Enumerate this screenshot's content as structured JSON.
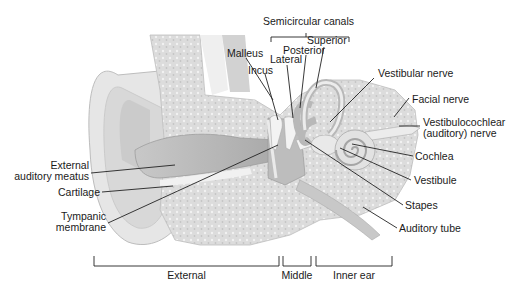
{
  "title": "Semicircular canals",
  "labels": {
    "semicircular_canals": "Semicircular canals",
    "superior": "Superior",
    "posterior": "Posterior",
    "lateral": "Lateral",
    "malleus": "Malleus",
    "incus": "Incus",
    "vestibular_nerve": "Vestibular nerve",
    "facial_nerve": "Facial nerve",
    "vestibulocochlear_1": "Vestibulocochlear",
    "vestibulocochlear_2": "(auditory) nerve",
    "cochlea": "Cochlea",
    "vestibule": "Vestibule",
    "stapes": "Stapes",
    "auditory_tube": "Auditory tube",
    "external_meatus_1": "External",
    "external_meatus_2": "auditory meatus",
    "cartilage": "Cartilage",
    "tympanic_1": "Tympanic",
    "tympanic_2": "membrane"
  },
  "regions": {
    "external": "External",
    "middle": "Middle",
    "inner": "Inner ear"
  },
  "colors": {
    "tissue_light": "#e4e4e4",
    "tissue_mid": "#cfcfcf",
    "tissue_dark": "#b5b5b5",
    "bone": "#d9d9d9",
    "line": "#222222"
  }
}
